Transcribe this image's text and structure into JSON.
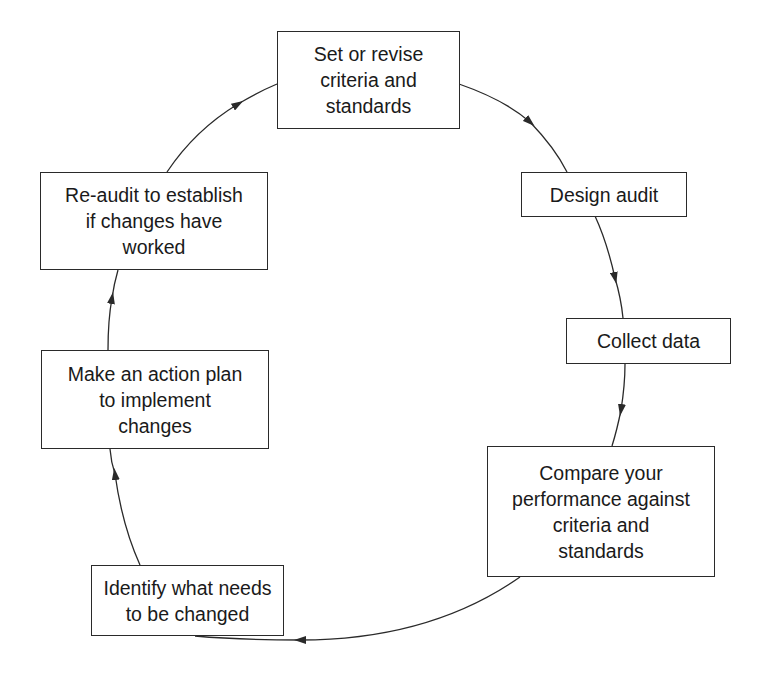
{
  "diagram": {
    "type": "cycle",
    "colors": {
      "stroke": "#2a2a2a",
      "text": "#1a1a1a",
      "background": "#ffffff"
    },
    "nodes": [
      {
        "id": "set-criteria",
        "label": "Set or revise\ncriteria and\nstandards"
      },
      {
        "id": "design-audit",
        "label": "Design audit"
      },
      {
        "id": "collect-data",
        "label": "Collect data"
      },
      {
        "id": "compare-performance",
        "label": "Compare your\nperformance against\ncriteria and\nstandards"
      },
      {
        "id": "identify-changes",
        "label": "Identify what needs\nto be changed"
      },
      {
        "id": "action-plan",
        "label": "Make an action plan\nto implement\nchanges"
      },
      {
        "id": "re-audit",
        "label": "Re-audit to establish\nif changes have\nworked"
      }
    ],
    "edges": [
      {
        "from": "set-criteria",
        "to": "design-audit"
      },
      {
        "from": "design-audit",
        "to": "collect-data"
      },
      {
        "from": "collect-data",
        "to": "compare-performance"
      },
      {
        "from": "compare-performance",
        "to": "identify-changes"
      },
      {
        "from": "identify-changes",
        "to": "action-plan"
      },
      {
        "from": "action-plan",
        "to": "re-audit"
      },
      {
        "from": "re-audit",
        "to": "set-criteria"
      }
    ]
  }
}
